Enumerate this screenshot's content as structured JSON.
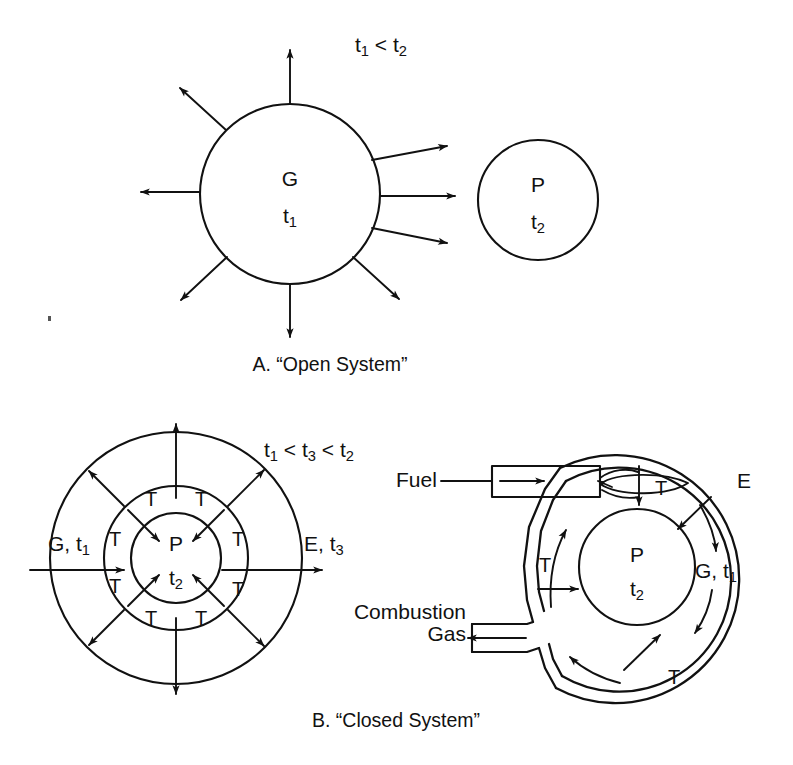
{
  "figure": {
    "background": "#ffffff",
    "ink": "#111111",
    "panels": [
      {
        "id": "panel-a",
        "caption": "A. “Open System”",
        "condition_label": {
          "text": "t₁ < t₂",
          "parts": [
            "t",
            "1",
            " < ",
            "t",
            "2"
          ]
        },
        "bodies": [
          {
            "name": "gas-body",
            "symbol": "G",
            "temperature": {
              "base": "t",
              "sub": "1"
            }
          },
          {
            "name": "product-body",
            "symbol": "P",
            "temperature": {
              "base": "t",
              "sub": "2"
            }
          }
        ],
        "radiating_arrows": 8
      },
      {
        "id": "panel-b",
        "caption": "B. “Closed System”",
        "condition_label": {
          "text": "t₁ < t₃ < t₂",
          "parts": [
            "t",
            "1",
            " < ",
            "t",
            "3",
            " < ",
            "t",
            "2"
          ]
        },
        "left_diagram": {
          "name": "concentric-shells-diagram",
          "center_symbol": "P",
          "center_temperature": {
            "base": "t",
            "sub": "2"
          },
          "inlet_label": {
            "base": "G, t",
            "sub": "1"
          },
          "outlet_label": {
            "base": "E, t",
            "sub": "3"
          },
          "transfer_markers": [
            "T",
            "T",
            "T",
            "T",
            "T",
            "T",
            "T",
            "T"
          ],
          "transfer_marker_count": 8
        },
        "right_diagram": {
          "name": "combustion-shell-diagram",
          "center_symbol": "P",
          "center_temperature": {
            "base": "t",
            "sub": "2"
          },
          "fuel_label": "Fuel",
          "exhaust_label_line1": "Combustion",
          "exhaust_label_line2": "Gas",
          "shell_label": "E",
          "gas_label": {
            "base": "G, t",
            "sub": "1"
          },
          "transfer_markers": [
            "T",
            "T",
            "T"
          ],
          "transfer_marker_count": 3
        }
      }
    ]
  }
}
